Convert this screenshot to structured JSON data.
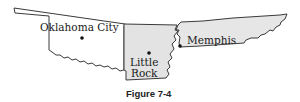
{
  "figure": {
    "caption": "Figure 7-4",
    "states": [
      {
        "name": "Oklahoma",
        "fill": "#ffffff"
      },
      {
        "name": "Arkansas",
        "fill": "#e3e3e3"
      },
      {
        "name": "Tennessee",
        "fill": "#e6e6e6"
      }
    ],
    "cities": [
      {
        "name": "Oklahoma City",
        "label": "Oklahoma City"
      },
      {
        "name": "Little Rock",
        "label_line1": "Little",
        "label_line2": "Rock"
      },
      {
        "name": "Memphis",
        "label": "Memphis"
      }
    ]
  }
}
